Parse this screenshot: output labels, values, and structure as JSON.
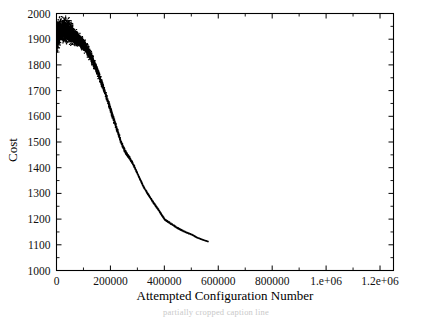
{
  "chart_data": {
    "type": "scatter",
    "title": "",
    "xlabel": "Attempted Configuration Number",
    "ylabel": "Cost",
    "xlim": [
      0,
      1250000
    ],
    "ylim": [
      1000,
      2000
    ],
    "grid": false,
    "legend": null,
    "x_ticks": [
      0,
      200000,
      400000,
      600000,
      800000,
      1000000,
      1200000
    ],
    "x_tick_labels": [
      "0",
      "200000",
      "400000",
      "600000",
      "800000",
      "1.e+06",
      "1.2e+06"
    ],
    "y_ticks": [
      1000,
      1100,
      1200,
      1300,
      1400,
      1500,
      1600,
      1700,
      1800,
      1900,
      2000
    ],
    "y_tick_labels": [
      "1000",
      "1100",
      "1200",
      "1300",
      "1400",
      "1500",
      "1600",
      "1700",
      "1800",
      "1900",
      "2000"
    ],
    "minor_x_ticks": [
      100000,
      300000,
      500000,
      700000,
      900000,
      1100000
    ],
    "minor_y_ticks": [
      1050,
      1150,
      1250,
      1350,
      1450,
      1550,
      1650,
      1750,
      1850,
      1950
    ],
    "marker_color": "#000000",
    "series": [
      {
        "name": "cost trace",
        "description": "Simulated annealing cost versus attempted configuration number: dense noisy cloud near 1850-1980 at the start, steep decline through 1500 around 250000, jagged descent to ~1150 by 500000, then a flat plateau at ~1085.",
        "x": [
          0,
          10000,
          20000,
          30000,
          40000,
          50000,
          60000,
          70000,
          80000,
          90000,
          100000,
          110000,
          120000,
          130000,
          140000,
          150000,
          160000,
          170000,
          180000,
          190000,
          200000,
          210000,
          220000,
          230000,
          240000,
          250000,
          260000,
          270000,
          280000,
          290000,
          300000,
          310000,
          320000,
          330000,
          340000,
          350000,
          360000,
          370000,
          380000,
          390000,
          400000,
          420000,
          440000,
          460000,
          480000,
          500000,
          520000,
          540000,
          560000,
          580000,
          600000,
          650000,
          700000,
          750000,
          800000,
          900000,
          1000000,
          1100000,
          1200000,
          1250000
        ],
        "y": [
          1905,
          1925,
          1930,
          1928,
          1925,
          1920,
          1915,
          1908,
          1900,
          1890,
          1878,
          1862,
          1845,
          1824,
          1800,
          1775,
          1748,
          1718,
          1688,
          1655,
          1622,
          1590,
          1558,
          1525,
          1495,
          1470,
          1452,
          1438,
          1420,
          1398,
          1375,
          1352,
          1330,
          1312,
          1295,
          1278,
          1262,
          1248,
          1232,
          1215,
          1200,
          1186,
          1172,
          1160,
          1150,
          1142,
          1130,
          1122,
          1115,
          1108,
          1102,
          1096,
          1092,
          1090,
          1089,
          1088,
          1087,
          1086,
          1086,
          1086
        ],
        "scatter_band_x_end": 300000,
        "scatter_band_halfwidth_start": 62,
        "scatter_band_halfwidth_end": 6
      }
    ]
  },
  "caption": {
    "ghost_text": "partially cropped caption line"
  }
}
